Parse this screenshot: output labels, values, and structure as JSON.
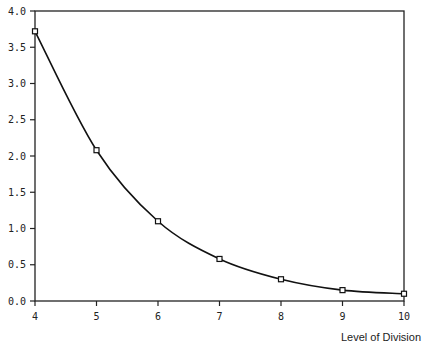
{
  "chart_data": {
    "type": "line",
    "title": "",
    "xlabel": "Level of Division",
    "ylabel": "",
    "x": [
      4,
      5,
      6,
      7,
      8,
      9,
      10
    ],
    "series": [
      {
        "name": "",
        "values": [
          3.72,
          2.08,
          1.1,
          0.58,
          0.3,
          0.15,
          0.1
        ],
        "marker": "square"
      }
    ],
    "xlim": [
      4,
      10
    ],
    "ylim": [
      0.0,
      4.0
    ],
    "xticks": [
      "4",
      "5",
      "6",
      "7",
      "8",
      "9",
      "10"
    ],
    "yticks": [
      "0.0",
      "0.5",
      "1.0",
      "1.5",
      "2.0",
      "2.5",
      "3.0",
      "3.5",
      "4.0"
    ],
    "grid": false,
    "legend": null,
    "colors": {
      "line": "#111111",
      "axis": "#222222"
    }
  }
}
